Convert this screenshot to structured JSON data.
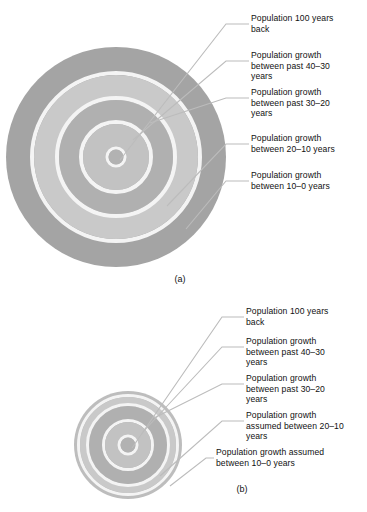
{
  "page": {
    "background": "#ffffff",
    "text_color": "#111111"
  },
  "palette": {
    "ring_dark": "#a8a8a8",
    "ring_light": "#c9c9c9",
    "ring_separator": "#f2f2f2",
    "leader_line": "#b4b4b4",
    "outline": "#dcdcdc"
  },
  "figures": [
    {
      "id": "a",
      "caption": "(a)",
      "diagram": {
        "type": "concentric-rings",
        "center_x": 116,
        "center_y": 157,
        "rings": [
          {
            "name": "population-100-years-back",
            "radius": 7.5,
            "fill": "#b0b0b0"
          },
          {
            "name": "growth-40-30",
            "radius": 33,
            "fill": "#c2c2c2"
          },
          {
            "name": "growth-30-20",
            "radius": 57,
            "fill": "#b0b0b0"
          },
          {
            "name": "growth-20-10",
            "radius": 82,
            "fill": "#c9c9c9"
          },
          {
            "name": "growth-10-0",
            "radius": 110,
            "fill": "#a4a4a4"
          }
        ]
      },
      "labels": [
        "Population 100 years\nback",
        "Population growth\nbetween past 40–30\nyears",
        "Population growth\nbetween past 30–20\nyears",
        "Population growth\nbetween 20–10 years",
        "Population growth\nbetween 10–0 years"
      ]
    },
    {
      "id": "b",
      "caption": "(b)",
      "diagram": {
        "type": "concentric-rings",
        "center_x": 128,
        "center_y": 155,
        "rings": [
          {
            "name": "population-100-years-back",
            "radius": 7.5,
            "fill": "#b0b0b0"
          },
          {
            "name": "growth-40-30",
            "radius": 23,
            "fill": "#c2c2c2"
          },
          {
            "name": "growth-30-20",
            "radius": 39,
            "fill": "#b0b0b0"
          },
          {
            "name": "growth-assumed-20-10",
            "radius": 48,
            "fill": "#c9c9c9"
          },
          {
            "name": "growth-assumed-10-0",
            "radius": 54,
            "fill": "#bdbdbd"
          }
        ]
      },
      "labels": [
        "Population 100 years\nback",
        "Population growth\nbetween past 40–30\nyears",
        "Population growth\nbetween past 30–20\nyears",
        "Population growth\nassumed between 20–10\nyears",
        "Population growth assumed\nbetween 10–0 years"
      ]
    }
  ]
}
